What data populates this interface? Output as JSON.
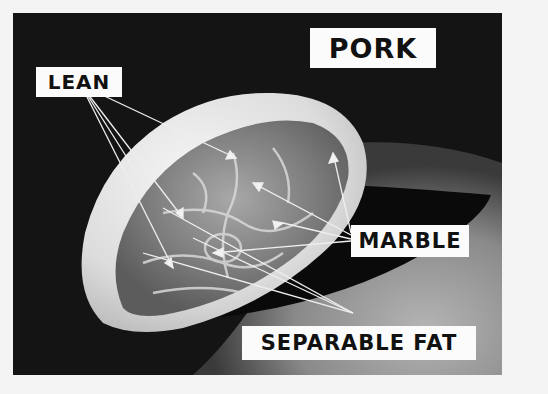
{
  "figure": {
    "labels": {
      "title": "PORK",
      "lean": "LEAN",
      "marble": "MARBLE",
      "separable_fat": "SEPARABLE FAT"
    },
    "colors": {
      "background": "#141414",
      "label_bg": "#fbfbfb",
      "label_text": "#111111",
      "meat_light": "#e8e8e8",
      "meat_mid": "#9a9a9a",
      "floor": "#9c9c9c",
      "shadow": "#0a0a0a"
    }
  }
}
